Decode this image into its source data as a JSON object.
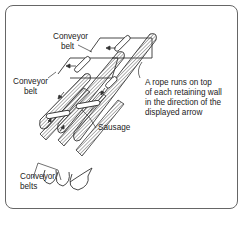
{
  "diagram": {
    "labels": {
      "conveyor_belt_top": [
        "Conveyor",
        "belt"
      ],
      "conveyor_belt_left": [
        "Conveyor",
        "belt"
      ],
      "rope_note": [
        "A rope runs on top",
        "of each retaining wall",
        "in the direction of the",
        "displayed arrow"
      ],
      "sausage": "Sausage",
      "conveyor_belts_bottom": [
        "Conveyor",
        "belts"
      ]
    },
    "colors": {
      "line": "#333333",
      "hatch": "#555555",
      "frame": "#666666",
      "background": "#ffffff"
    }
  }
}
